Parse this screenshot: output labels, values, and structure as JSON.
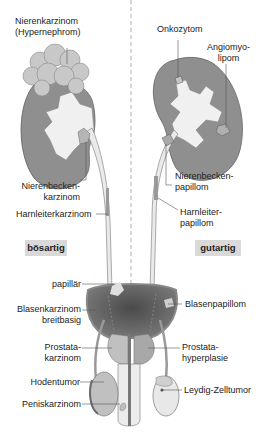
{
  "diagram": {
    "sides": {
      "left": "bösartig",
      "right": "gutartig"
    },
    "labels_malignant": {
      "nierenkarzinom": "Nierenkarzinom\n(Hypernephrom)",
      "nierenbeckenkarzinom": "Nierenbecken-\nkarzinom",
      "harnleiterkarzinom": "Harnleiterkarzinom",
      "papillaer": "papillär",
      "blasenkarzinom": "Blasenkarzinom\nbreitbasig",
      "prostatakarzinom": "Prostata-\nkarzinom",
      "hodentumor": "Hodentumor",
      "peniskarzinom": "Peniskarzinom"
    },
    "labels_benign": {
      "onkozytom": "Onkozytom",
      "angiomyolipom": "Angiomyo-\nlipom",
      "nierenbeckenpapillom": "Nierenbecken-\npapillom",
      "harnleiterpapillom": "Harnleiter-\npapillom",
      "blasenpapillom": "Blasenpapillom",
      "prostatahyperplasie": "Prostata-\nhyperplasie",
      "leydig": "Leydig-Zelltumor"
    },
    "colors": {
      "kidney": "#8f8f8f",
      "pelvis": "#f0f0f0",
      "tumor": "#c4c4c4",
      "bladder": "#5e5e5e",
      "badge": "#d9d9d9",
      "leader": "#555555"
    }
  }
}
